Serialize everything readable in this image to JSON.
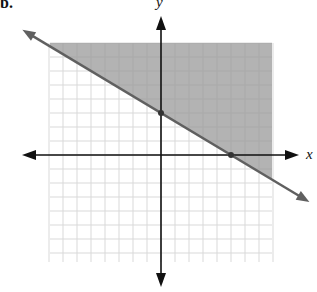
{
  "problem": {
    "number_label": "b."
  },
  "axes": {
    "x_label": "x",
    "y_label": "y"
  },
  "colors": {
    "grid": "#d9d9d9",
    "shade": "#9a9a9a",
    "boundary": "#606060",
    "axis": "#111111"
  },
  "chart_data": {
    "type": "line",
    "title": "",
    "xlabel": "x",
    "ylabel": "y",
    "xlim": [
      -8,
      8
    ],
    "ylim": [
      -8,
      8
    ],
    "grid": true,
    "grid_step": 1,
    "boundary_line": {
      "style": "solid",
      "points": [
        {
          "x": 0,
          "y": 3
        },
        {
          "x": 5,
          "y": 0
        }
      ],
      "slope": -0.6,
      "y_intercept": 3,
      "x_intercept": 5,
      "equation": "3x + 5y = 15"
    },
    "inequality": "3x + 5y ≥ 15",
    "shaded_region": "above the line",
    "marked_points": [
      {
        "x": 0,
        "y": 3
      },
      {
        "x": 5,
        "y": 0
      }
    ]
  }
}
